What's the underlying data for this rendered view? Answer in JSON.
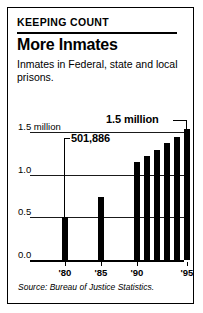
{
  "header": {
    "kicker": "KEEPING COUNT",
    "headline": "More Inmates",
    "deck": "Inmates in Federal, state and local prisons."
  },
  "source": "Source: Bureau of Justice Statistics.",
  "callouts": {
    "first": "501,886",
    "last": "1.5 million"
  },
  "chart_data": {
    "type": "bar",
    "title": "More Inmates",
    "subtitle": "Inmates in Federal, state and local prisons.",
    "xlabel": "",
    "ylabel": "",
    "ylim": [
      0.0,
      1.5
    ],
    "yticks": [
      0.0,
      0.5,
      1.0,
      1.5
    ],
    "ytick_labels": [
      "0.0",
      "0.5",
      "1.0",
      "1.5 million"
    ],
    "grid": true,
    "legend": null,
    "units": "millions of inmates",
    "categories": [
      "'80",
      "'85",
      "'90",
      "'91",
      "'92",
      "'93",
      "'94",
      "'95"
    ],
    "xtick_labels": [
      "'80",
      "'85",
      "'90",
      "'95"
    ],
    "values": [
      0.5,
      0.74,
      1.15,
      1.22,
      1.29,
      1.37,
      1.44,
      1.53
    ],
    "annotations": [
      {
        "label": "501,886",
        "category": "'80",
        "value": 0.501886
      },
      {
        "label": "1.5 million",
        "category": "'95",
        "value": 1.5
      }
    ]
  }
}
